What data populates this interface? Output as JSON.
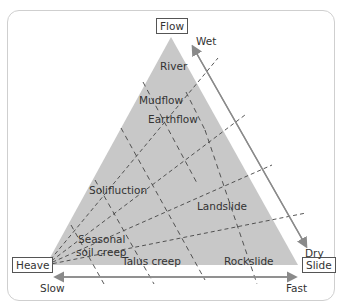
{
  "diagram": {
    "corners": {
      "top": "Flow",
      "left": "Heave",
      "right": "Slide"
    },
    "moisture_axis": {
      "top": "Wet",
      "bottom": "Dry"
    },
    "speed_axis": {
      "left": "Slow",
      "right": "Fast"
    },
    "regions": {
      "river": "River",
      "mudflow": "Mudflow",
      "earthflow": "Earthflow",
      "solifluction": "Solifluction",
      "landslide": "Landslide",
      "seasonal_soil_creep_line1": "Seasonal",
      "seasonal_soil_creep_line2": "soil creep",
      "talus_creep": "Talus creep",
      "rockslide": "Rockslide"
    },
    "colors": {
      "triangle_fill": "#c8c8c8",
      "arrow": "#8a8a8a",
      "dash": "#444444",
      "frame": "#cfcfcf"
    }
  }
}
